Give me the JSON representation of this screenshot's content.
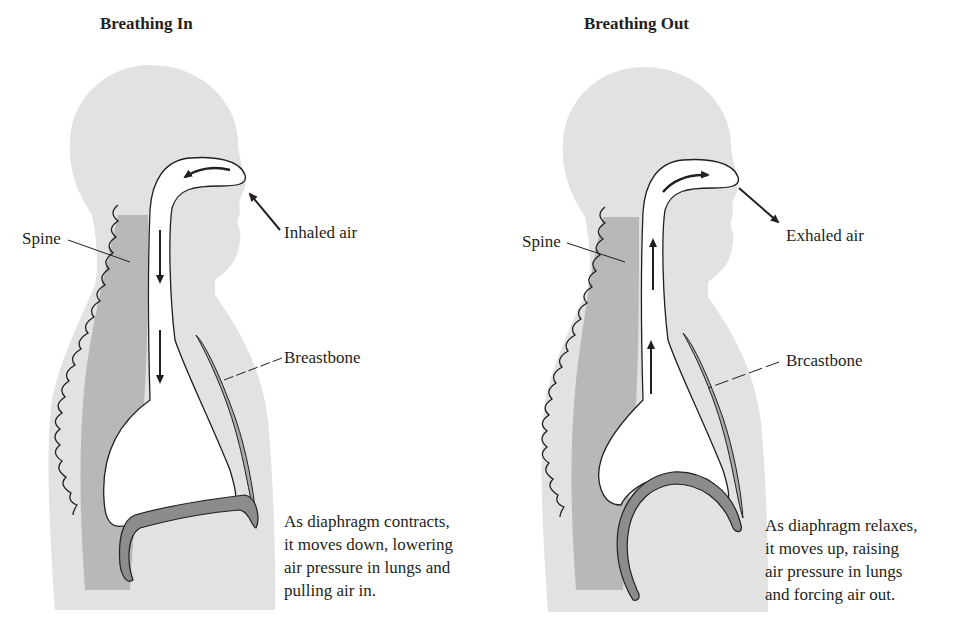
{
  "colors": {
    "body_fill": "#e2e2e2",
    "spine_fill": "#b4b4b4",
    "bone_fill": "#a9a9a9",
    "diaphragm_fill": "#8c8c8c",
    "line": "#231f20",
    "airway_fill": "#ffffff"
  },
  "panels": [
    {
      "id": "breathing-in",
      "title": "Breathing In",
      "labels": {
        "spine": "Spine",
        "air": "Inhaled air",
        "breastbone": "Breastbone"
      },
      "caption": [
        "As diaphragm contracts,",
        "it moves down, lowering",
        "air pressure in lungs and",
        "pulling air in."
      ],
      "airflow_direction": "in",
      "diaphragm_state": "contracted-flat"
    },
    {
      "id": "breathing-out",
      "title": "Breathing Out",
      "labels": {
        "spine": "Spine",
        "air": "Exhaled air",
        "breastbone": "Brcastbone"
      },
      "caption": [
        "As diaphragm relaxes,",
        "it moves up, raising",
        "air pressure in lungs",
        "and forcing air out."
      ],
      "airflow_direction": "out",
      "diaphragm_state": "relaxed-domed"
    }
  ]
}
